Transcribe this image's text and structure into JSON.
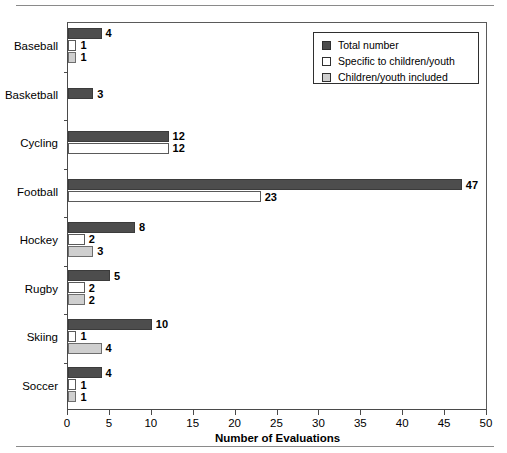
{
  "chart_data": {
    "type": "bar",
    "orientation": "horizontal",
    "title": "",
    "xlabel": "Number of Evaluations",
    "ylabel": "",
    "xlim": [
      0,
      50
    ],
    "xticks": [
      0,
      5,
      10,
      15,
      20,
      25,
      30,
      35,
      40,
      45,
      50
    ],
    "grid": false,
    "legend_position": "top-right",
    "categories": [
      "Baseball",
      "Basketball",
      "Cycling",
      "Football",
      "Hockey",
      "Rugby",
      "Skiing",
      "Soccer"
    ],
    "series": [
      {
        "name": "Total number",
        "color": "#4d4d4d",
        "values": [
          4,
          3,
          12,
          47,
          8,
          5,
          10,
          4
        ]
      },
      {
        "name": "Specific to children/youth",
        "color": "#ffffff",
        "values": [
          1,
          null,
          12,
          23,
          2,
          2,
          1,
          1
        ]
      },
      {
        "name": "Children/youth included",
        "color": "#cfcfcf",
        "values": [
          1,
          null,
          null,
          null,
          3,
          2,
          4,
          1
        ]
      }
    ]
  },
  "axis": {
    "x_title": "Number of Evaluations",
    "tick_labels": [
      "0",
      "5",
      "10",
      "15",
      "20",
      "25",
      "30",
      "35",
      "40",
      "45",
      "50"
    ]
  },
  "legend": {
    "items": [
      {
        "label": "Total number",
        "swatch": "dark-gray-filled-square"
      },
      {
        "label": "Specific to children/youth",
        "swatch": "white-open-square"
      },
      {
        "label": "Children/youth included",
        "swatch": "light-gray-filled-square"
      }
    ]
  },
  "colors": {
    "series_total": "#4d4d4d",
    "series_specific": "#ffffff",
    "series_included": "#cfcfcf",
    "axis": "#4a4a4a",
    "rule": "#8a8a8a"
  }
}
